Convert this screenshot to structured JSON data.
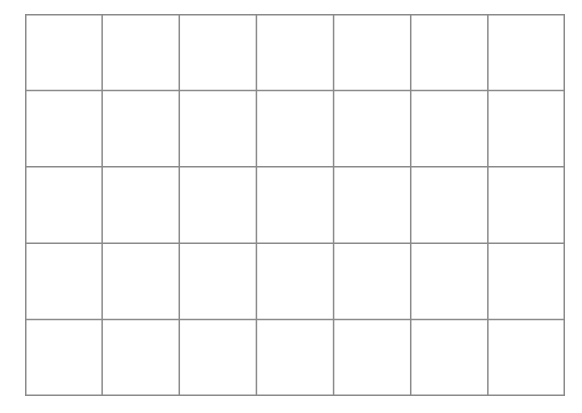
{
  "grid": {
    "columns": 7,
    "rows": 5,
    "line_color": "#8a8a8a",
    "background": "#ffffff"
  }
}
